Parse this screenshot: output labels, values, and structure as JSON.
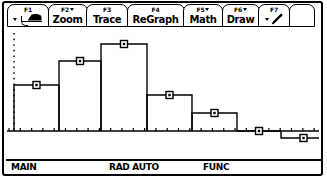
{
  "device": {
    "name": "TI graphing calculator",
    "screen_label": "statistics histogram plot"
  },
  "toolbar": {
    "items": [
      {
        "fkey": "F1",
        "label": "",
        "icon": "tools-icon",
        "has_dropdown": true
      },
      {
        "fkey": "F2",
        "label": "Zoom",
        "icon": "",
        "has_dropdown": true
      },
      {
        "fkey": "F3",
        "label": "Trace",
        "icon": "",
        "has_dropdown": false
      },
      {
        "fkey": "F4",
        "label": "ReGraph",
        "icon": "",
        "has_dropdown": false
      },
      {
        "fkey": "F5",
        "label": "Math",
        "icon": "",
        "has_dropdown": true
      },
      {
        "fkey": "F6",
        "label": "Draw",
        "icon": "",
        "has_dropdown": true
      },
      {
        "fkey": "F7",
        "label": "",
        "icon": "pencil-icon",
        "has_dropdown": true
      },
      {
        "fkey": "",
        "label": "",
        "icon": "",
        "has_dropdown": false
      }
    ]
  },
  "status_bar": {
    "folder": "MAIN",
    "mode": "RAD AUTO",
    "graph_mode": "FUNC"
  },
  "colors": {
    "ink": "#000000",
    "background": "#ffffff"
  },
  "chart_data": {
    "type": "bar",
    "title": "",
    "xlabel": "",
    "ylabel": "",
    "grid": false,
    "legend": "none",
    "note": "Histogram with square plot markers centered on the top of each bin; y-axis drawn as a dotted vertical line, x-axis as a solid line with tick marks.",
    "categories": [
      "1",
      "2",
      "3",
      "4",
      "5",
      "6",
      "7"
    ],
    "values": [
      7,
      10,
      12,
      5.5,
      3.5,
      0,
      1.5
    ],
    "bar_pixel_tops": [
      85,
      61,
      44,
      95,
      113,
      131,
      138
    ],
    "bar_pixel_edges": [
      14,
      59,
      101,
      147,
      192,
      237,
      281,
      326
    ],
    "baseline_pixel_y": 131,
    "ylim": [
      0,
      14
    ],
    "xlim": [
      0,
      7
    ],
    "marker": "square"
  }
}
